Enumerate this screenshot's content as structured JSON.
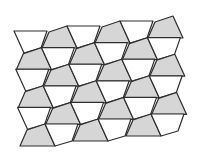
{
  "figure": {
    "width": 198,
    "height": 158,
    "colors": {
      "background": "#ffffff",
      "gray_fill": "#d6d6d6",
      "white_fill": "#ffffff",
      "stroke": "#2e2e2e"
    },
    "stroke_width": 1.2,
    "lattice": {
      "origin": [
        49,
        32
      ],
      "v1": [
        53,
        -5
      ],
      "v2": [
        -25.6,
        21.6
      ]
    },
    "prototiles": {
      "gray": [
        [
          0,
          0
        ],
        [
          18,
          -6
        ],
        [
          28,
          16
        ],
        [
          -7,
          16
        ]
      ],
      "white": [
        [
          18,
          -6
        ],
        [
          51,
          -6
        ],
        [
          45,
          11
        ],
        [
          28,
          16
        ]
      ]
    },
    "tiles": [
      {
        "type": "white",
        "i": -1,
        "j": 0
      },
      {
        "type": "gray",
        "i": 0,
        "j": 0
      },
      {
        "type": "white",
        "i": 0,
        "j": 0
      },
      {
        "type": "gray",
        "i": 1,
        "j": 0
      },
      {
        "type": "white",
        "i": 1,
        "j": 0
      },
      {
        "type": "gray",
        "i": 2,
        "j": 0
      },
      {
        "type": "gray",
        "i": 0,
        "j": 1
      },
      {
        "type": "white",
        "i": 0,
        "j": 1
      },
      {
        "type": "gray",
        "i": 1,
        "j": 1
      },
      {
        "type": "white",
        "i": 1,
        "j": 1
      },
      {
        "type": "gray",
        "i": 2,
        "j": 1
      },
      {
        "type": "white",
        "i": 2,
        "j": 1
      },
      {
        "type": "white",
        "i": 0,
        "j": 2
      },
      {
        "type": "gray",
        "i": 1,
        "j": 2
      },
      {
        "type": "white",
        "i": 1,
        "j": 2
      },
      {
        "type": "gray",
        "i": 2,
        "j": 2
      },
      {
        "type": "white",
        "i": 2,
        "j": 2
      },
      {
        "type": "gray",
        "i": 3,
        "j": 2
      },
      {
        "type": "gray",
        "i": 1,
        "j": 3
      },
      {
        "type": "white",
        "i": 1,
        "j": 3
      },
      {
        "type": "gray",
        "i": 2,
        "j": 3
      },
      {
        "type": "white",
        "i": 2,
        "j": 3
      },
      {
        "type": "gray",
        "i": 3,
        "j": 3
      },
      {
        "type": "white",
        "i": 3,
        "j": 3
      },
      {
        "type": "white",
        "i": 1,
        "j": 4
      },
      {
        "type": "gray",
        "i": 2,
        "j": 4
      },
      {
        "type": "white",
        "i": 2,
        "j": 4
      },
      {
        "type": "gray",
        "i": 3,
        "j": 4
      },
      {
        "type": "white",
        "i": 3,
        "j": 4
      },
      {
        "type": "gray",
        "i": 4,
        "j": 4
      },
      {
        "type": "gray",
        "i": 2,
        "j": 5
      },
      {
        "type": "white",
        "i": 2,
        "j": 5
      },
      {
        "type": "gray",
        "i": 3,
        "j": 5
      },
      {
        "type": "white",
        "i": 3,
        "j": 5
      },
      {
        "type": "gray",
        "i": 4,
        "j": 5
      },
      {
        "type": "white",
        "i": 4,
        "j": 5
      }
    ],
    "counts": {
      "gray_tiles": 18,
      "white_tiles": 18
    }
  }
}
